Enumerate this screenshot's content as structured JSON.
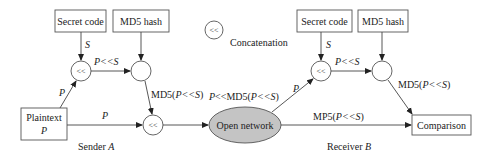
{
  "diagram": {
    "sender": {
      "label": "Sender",
      "label_var": "A",
      "secret_code": "Secret code",
      "secret_edge": "S",
      "md5_hash": "MD5 hash",
      "plaintext_label": "Plaintext",
      "plaintext_var": "P",
      "edge_p_upper": "P",
      "edge_p_lower": "P",
      "edge_concat": "P<<S",
      "edge_hash_prefix": "MD5(",
      "edge_hash_var": "P<<S",
      "edge_hash_suffix": ")",
      "concat_symbol": "<<"
    },
    "network": {
      "label": "Open network",
      "edge_top_prefix": "P<<MD5(",
      "edge_top_var": "P<<S",
      "edge_top_suffix": ")",
      "edge_to_receiver": "P",
      "edge_direct_prefix": "MP5(",
      "edge_direct_var": "P<<S",
      "edge_direct_suffix": ")"
    },
    "receiver": {
      "label": "Receiver",
      "label_var": "B",
      "secret_code": "Secret code",
      "secret_edge": "S",
      "md5_hash": "MD5 hash",
      "edge_concat": "P<<S",
      "edge_hash_prefix": "MD5(",
      "edge_hash_var": "P<<S",
      "edge_hash_suffix": ")",
      "comparison": "Comparison",
      "concat_symbol": "<<"
    },
    "legend": {
      "symbol": "<<",
      "label": "Concatenation"
    },
    "colors": {
      "network_fill": "#c4c4c4",
      "stroke": "#555555"
    }
  }
}
